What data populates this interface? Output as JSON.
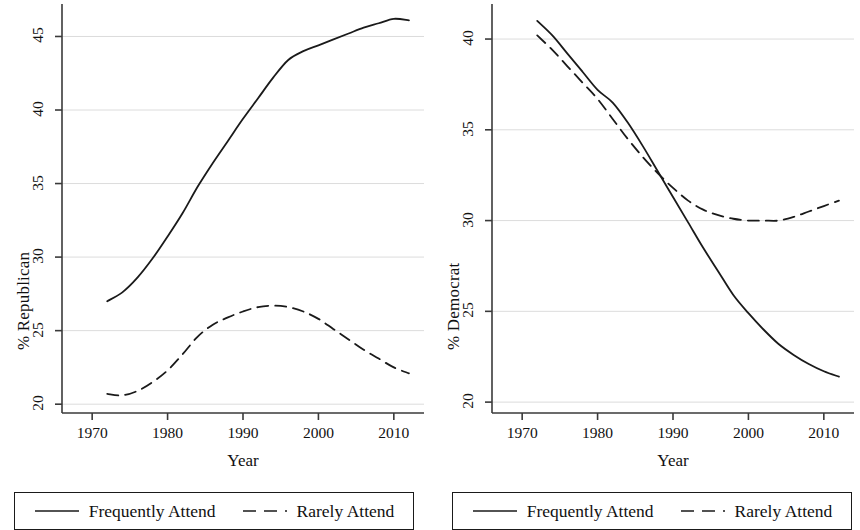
{
  "figure": {
    "width": 860,
    "height": 530,
    "background": "#ffffff",
    "line_color": "#1a1a1a",
    "grid_color": "#dcdcdc"
  },
  "legend": {
    "entries": [
      {
        "label": "Frequently Attend",
        "style": "solid",
        "swatch": "solid-line-icon"
      },
      {
        "label": "Rarely Attend",
        "style": "dashed",
        "swatch": "dashed-line-icon"
      }
    ]
  },
  "chart_data": [
    {
      "type": "line",
      "panel": "left",
      "title": "",
      "xlabel": "Year",
      "ylabel": "% Republican",
      "xlim": [
        1966,
        2014
      ],
      "ylim": [
        19.4,
        46.8
      ],
      "xticks": [
        1970,
        1980,
        1990,
        2000,
        2010
      ],
      "yticks": [
        20,
        25,
        30,
        35,
        40,
        45
      ],
      "xtick_labels": [
        "1970",
        "1980",
        "1990",
        "2000",
        "2010"
      ],
      "ytick_labels": [
        "20",
        "25",
        "30",
        "35",
        "40",
        "45"
      ],
      "grid": "horizontal",
      "legend_position": "below",
      "series": [
        {
          "name": "Frequently Attend",
          "style": "solid",
          "x": [
            1972,
            1974,
            1976,
            1978,
            1980,
            1982,
            1984,
            1986,
            1988,
            1990,
            1992,
            1994,
            1996,
            1998,
            2000,
            2002,
            2004,
            2006,
            2008,
            2010,
            2012
          ],
          "values": [
            27.0,
            27.6,
            28.6,
            29.9,
            31.4,
            33.0,
            34.8,
            36.4,
            37.9,
            39.4,
            40.8,
            42.2,
            43.4,
            44.0,
            44.4,
            44.8,
            45.2,
            45.6,
            45.9,
            46.2,
            46.1
          ]
        },
        {
          "name": "Rarely Attend",
          "style": "dashed",
          "x": [
            1972,
            1974,
            1976,
            1978,
            1980,
            1982,
            1984,
            1986,
            1988,
            1990,
            1992,
            1994,
            1996,
            1998,
            2000,
            2002,
            2004,
            2006,
            2008,
            2010,
            2012
          ],
          "values": [
            20.7,
            20.6,
            20.9,
            21.5,
            22.3,
            23.4,
            24.6,
            25.4,
            25.9,
            26.3,
            26.6,
            26.7,
            26.6,
            26.3,
            25.8,
            25.1,
            24.4,
            23.7,
            23.1,
            22.5,
            22.1
          ]
        }
      ]
    },
    {
      "type": "line",
      "panel": "right",
      "title": "",
      "xlabel": "Year",
      "ylabel": "% Democrat",
      "xlim": [
        1966,
        2014
      ],
      "ylim": [
        19.4,
        41.6
      ],
      "xticks": [
        1970,
        1980,
        1990,
        2000,
        2010
      ],
      "yticks": [
        20,
        25,
        30,
        35,
        40
      ],
      "xtick_labels": [
        "1970",
        "1980",
        "1990",
        "2000",
        "2010"
      ],
      "ytick_labels": [
        "20",
        "25",
        "30",
        "35",
        "40"
      ],
      "grid": "horizontal",
      "legend_position": "below",
      "series": [
        {
          "name": "Frequently Attend",
          "style": "solid",
          "x": [
            1972,
            1974,
            1976,
            1978,
            1980,
            1982,
            1984,
            1986,
            1988,
            1990,
            1992,
            1994,
            1996,
            1998,
            2000,
            2002,
            2004,
            2006,
            2008,
            2010,
            2012
          ],
          "values": [
            41.0,
            40.2,
            39.2,
            38.2,
            37.2,
            36.5,
            35.4,
            34.1,
            32.7,
            31.3,
            29.9,
            28.5,
            27.2,
            25.9,
            24.9,
            24.0,
            23.2,
            22.6,
            22.1,
            21.7,
            21.4
          ]
        },
        {
          "name": "Rarely Attend",
          "style": "dashed",
          "x": [
            1972,
            1974,
            1976,
            1978,
            1980,
            1982,
            1984,
            1986,
            1988,
            1990,
            1992,
            1994,
            1996,
            1998,
            2000,
            2002,
            2004,
            2006,
            2008,
            2010,
            2012
          ],
          "values": [
            40.2,
            39.4,
            38.5,
            37.6,
            36.7,
            35.6,
            34.5,
            33.5,
            32.6,
            31.8,
            31.1,
            30.6,
            30.3,
            30.1,
            30.0,
            30.0,
            30.0,
            30.2,
            30.5,
            30.8,
            31.1
          ]
        }
      ]
    }
  ]
}
